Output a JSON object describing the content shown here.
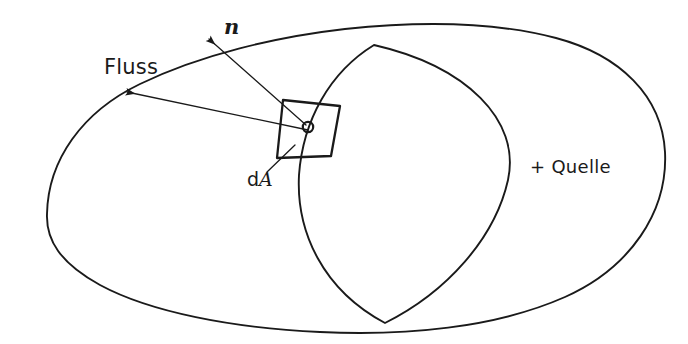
{
  "figure": {
    "kind": "hand-drawn-physics-diagram",
    "topic": "Elektrischer Fluss durch eine geschlossene Oberflaeche",
    "background_color": "#ffffff",
    "ink_color": "#1a1a1a",
    "width": 688,
    "height": 344
  },
  "labels": {
    "flux": "Fluss",
    "normal_vector": "n",
    "area_element_d": "d",
    "area_element_A": "A",
    "source": "+ Quelle"
  },
  "shapes": {
    "closed_surface": {
      "name": "geschlossene Huellflaeche",
      "path": "M 47 214 C 48 160 82 112 140 84 C 200 55 275 37 345 29 C 420 21 495 22 556 38 C 620 55 662 96 665 152 C 668 212 630 268 565 297 C 495 328 405 336 320 332 C 232 328 150 312 100 285 C 60 263 46 240 47 214 Z",
      "stroke_width": 1.9
    },
    "cross_section_ellipse": {
      "name": "Querschnitt-Ellipse",
      "path": "M 374 45 C 330 72 303 120 299 175 C 296 232 323 290 385 323 C 447 292 495 238 508 180 C 521 120 466 66 374 45 Z",
      "stroke_width": 1.9
    },
    "area_patch": {
      "name": "Flaechenelement dA",
      "points": "283,100 340,106 331,156 277,158",
      "stroke_width": 2.3
    },
    "patch_center_marker": {
      "name": "Fusspunkt",
      "cx": 308,
      "cy": 127,
      "r": 5.2,
      "stroke_width": 2.2
    }
  },
  "arrows": {
    "normal": {
      "name": "Normalenvektor n",
      "from_x": 306,
      "from_y": 125,
      "to_x": 209,
      "to_y": 39,
      "stroke_width": 1.3
    },
    "flux": {
      "name": "Flussvektor",
      "from_x": 308,
      "from_y": 130,
      "to_x": 127,
      "to_y": 92,
      "stroke_width": 1.3
    }
  },
  "leaders": {
    "area_label": {
      "name": "Hinweislinie dA",
      "from_x": 267,
      "from_y": 172,
      "to_x": 295,
      "to_y": 145,
      "stroke_width": 1.3
    }
  }
}
